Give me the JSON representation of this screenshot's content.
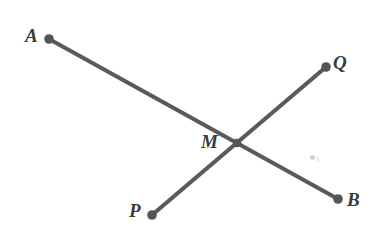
{
  "figure": {
    "canvas": {
      "width": 381,
      "height": 235,
      "background": "#ffffff"
    },
    "style": {
      "stroke_color": "#5a5a5a",
      "stroke_width": 4,
      "dot_color": "#555555",
      "dot_radius": 4.6,
      "label_color": "#3b3b3b",
      "label_font_size": 19
    },
    "points": [
      {
        "id": "A",
        "label": "A",
        "x": 49,
        "y": 39,
        "label_x": 25,
        "label_y": 26,
        "has_dot": true
      },
      {
        "id": "B",
        "label": "B",
        "x": 338,
        "y": 199,
        "label_x": 347,
        "label_y": 190,
        "has_dot": true
      },
      {
        "id": "P",
        "label": "P",
        "x": 152,
        "y": 215,
        "label_x": 129,
        "label_y": 201,
        "has_dot": true
      },
      {
        "id": "Q",
        "label": "Q",
        "x": 326,
        "y": 67,
        "label_x": 333,
        "label_y": 53,
        "has_dot": true
      },
      {
        "id": "M",
        "label": "M",
        "x": 237,
        "y": 143,
        "label_x": 201,
        "label_y": 132,
        "has_dot": true
      }
    ],
    "segments": [
      {
        "id": "AB",
        "from": "A",
        "to": "B",
        "label": "Segment AB",
        "x1": 49,
        "y1": 39,
        "x2": 338,
        "y2": 199
      },
      {
        "id": "PQ",
        "from": "P",
        "to": "Q",
        "label": "Segment PQ",
        "x1": 152,
        "y1": 215,
        "x2": 326,
        "y2": 67
      }
    ],
    "intersection": {
      "id": "M",
      "label": "M",
      "x": 237,
      "y": 143
    },
    "artifacts": [
      {
        "id": "speck",
        "x": 312,
        "y": 158,
        "width": 9,
        "height": 7,
        "color": "#d8d8d8"
      }
    ]
  }
}
